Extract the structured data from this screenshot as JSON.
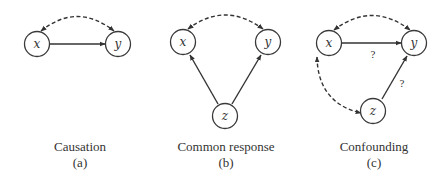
{
  "panels": [
    {
      "id": "a",
      "title": "Causation",
      "letter": "(a)",
      "caption_x": 80,
      "nodes": [
        {
          "id": "x",
          "label": "x",
          "cx": 37,
          "cy": 44
        },
        {
          "id": "y",
          "label": "y",
          "cx": 118,
          "cy": 44
        }
      ],
      "edges": [
        {
          "from": "x",
          "to": "y",
          "style": "solid",
          "direction": "forward",
          "label": ""
        },
        {
          "from": "x",
          "to": "y",
          "style": "dashed",
          "direction": "both",
          "shape": "arc-over",
          "label": ""
        }
      ]
    },
    {
      "id": "b",
      "title": "Common response",
      "letter": "(b)",
      "caption_x": 226,
      "nodes": [
        {
          "id": "x",
          "label": "x",
          "cx": 183,
          "cy": 42
        },
        {
          "id": "y",
          "label": "y",
          "cx": 268,
          "cy": 42
        },
        {
          "id": "z",
          "label": "z",
          "cx": 225,
          "cy": 116
        }
      ],
      "edges": [
        {
          "from": "z",
          "to": "x",
          "style": "solid",
          "direction": "forward",
          "label": ""
        },
        {
          "from": "z",
          "to": "y",
          "style": "solid",
          "direction": "forward",
          "label": ""
        },
        {
          "from": "x",
          "to": "y",
          "style": "dashed",
          "direction": "both",
          "shape": "arc-over",
          "label": ""
        }
      ]
    },
    {
      "id": "c",
      "title": "Confounding",
      "letter": "(c)",
      "caption_x": 374,
      "nodes": [
        {
          "id": "x",
          "label": "x",
          "cx": 329,
          "cy": 43
        },
        {
          "id": "y",
          "label": "y",
          "cx": 414,
          "cy": 43
        },
        {
          "id": "z",
          "label": "z",
          "cx": 373,
          "cy": 111
        }
      ],
      "edges": [
        {
          "from": "x",
          "to": "y",
          "style": "solid",
          "direction": "forward",
          "label": "?"
        },
        {
          "from": "z",
          "to": "y",
          "style": "solid",
          "direction": "forward",
          "label": "?"
        },
        {
          "from": "x",
          "to": "y",
          "style": "dashed",
          "direction": "both",
          "shape": "arc-over",
          "label": ""
        },
        {
          "from": "x",
          "to": "z",
          "style": "dashed",
          "direction": "both",
          "shape": "arc-left",
          "label": ""
        }
      ]
    }
  ],
  "colors": {
    "stroke": "#333333",
    "background": "#ffffff"
  }
}
